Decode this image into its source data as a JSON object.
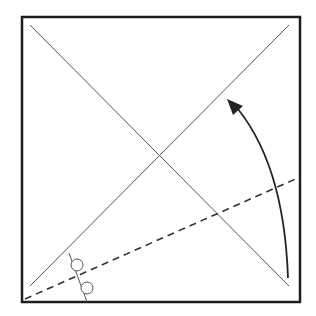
{
  "diagram": {
    "type": "origami-fold-step",
    "colors": {
      "background": "#ffffff",
      "border": "#1e1e1e",
      "crease": "#555555",
      "valley_fold": "#333333",
      "arrow": "#222222",
      "marker": "#555555"
    },
    "paper": {
      "shape": "square",
      "x": 22,
      "y": 17,
      "width": 278,
      "height": 285
    },
    "creases": [
      {
        "name": "diagonal-top-left-to-bottom-right",
        "x1": 30,
        "y1": 25,
        "x2": 289,
        "y2": 286
      },
      {
        "name": "diagonal-bottom-left-to-top-right",
        "x1": 30,
        "y1": 286,
        "x2": 289,
        "y2": 25
      }
    ],
    "valley_fold_line": {
      "x1": 25,
      "y1": 299,
      "x2": 300,
      "y2": 177,
      "style": "dashed"
    },
    "arrow": {
      "description": "fold bottom-right corner up along dashed line",
      "path": "M 288 278 Q 284 160 232 102",
      "head": {
        "tip_x": 227,
        "tip_y": 99
      }
    },
    "equal_angle_marker": {
      "tick_line": {
        "x1": 69,
        "y1": 253,
        "x2": 87,
        "y2": 302
      },
      "circles": [
        {
          "cx": 77,
          "cy": 265,
          "r": 6
        },
        {
          "cx": 87,
          "cy": 288,
          "r": 6
        }
      ]
    }
  }
}
